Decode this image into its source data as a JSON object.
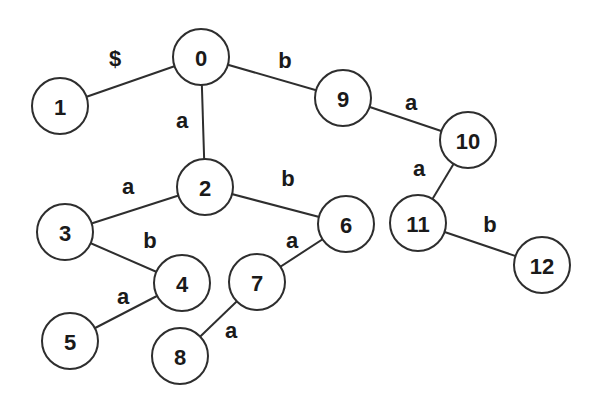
{
  "diagram": {
    "type": "trie",
    "node_radius": 28,
    "stroke_color": "#2e2e2e",
    "text_color": "#1a1a1a",
    "nodes": [
      {
        "id": "0",
        "label": "0",
        "x": 201,
        "y": 57
      },
      {
        "id": "1",
        "label": "1",
        "x": 60,
        "y": 106
      },
      {
        "id": "2",
        "label": "2",
        "x": 205,
        "y": 187
      },
      {
        "id": "3",
        "label": "3",
        "x": 65,
        "y": 232
      },
      {
        "id": "4",
        "label": "4",
        "x": 182,
        "y": 283
      },
      {
        "id": "5",
        "label": "5",
        "x": 70,
        "y": 341
      },
      {
        "id": "6",
        "label": "6",
        "x": 346,
        "y": 224
      },
      {
        "id": "7",
        "label": "7",
        "x": 257,
        "y": 282
      },
      {
        "id": "8",
        "label": "8",
        "x": 180,
        "y": 356
      },
      {
        "id": "9",
        "label": "9",
        "x": 343,
        "y": 98
      },
      {
        "id": "10",
        "label": "10",
        "x": 468,
        "y": 140
      },
      {
        "id": "11",
        "label": "11",
        "x": 418,
        "y": 223
      },
      {
        "id": "12",
        "label": "12",
        "x": 542,
        "y": 265
      }
    ],
    "edges": [
      {
        "from": "0",
        "to": "1",
        "label": "$",
        "lx": 115,
        "ly": 58
      },
      {
        "from": "0",
        "to": "2",
        "label": "a",
        "lx": 182,
        "ly": 120
      },
      {
        "from": "0",
        "to": "9",
        "label": "b",
        "lx": 285,
        "ly": 60
      },
      {
        "from": "2",
        "to": "3",
        "label": "a",
        "lx": 128,
        "ly": 186
      },
      {
        "from": "2",
        "to": "6",
        "label": "b",
        "lx": 288,
        "ly": 178
      },
      {
        "from": "3",
        "to": "4",
        "label": "b",
        "lx": 150,
        "ly": 240
      },
      {
        "from": "4",
        "to": "5",
        "label": "a",
        "lx": 123,
        "ly": 296
      },
      {
        "from": "6",
        "to": "7",
        "label": "a",
        "lx": 292,
        "ly": 240
      },
      {
        "from": "7",
        "to": "8",
        "label": "a",
        "lx": 231,
        "ly": 330
      },
      {
        "from": "9",
        "to": "10",
        "label": "a",
        "lx": 411,
        "ly": 102
      },
      {
        "from": "10",
        "to": "11",
        "label": "a",
        "lx": 419,
        "ly": 168
      },
      {
        "from": "11",
        "to": "12",
        "label": "b",
        "lx": 490,
        "ly": 224
      }
    ]
  }
}
